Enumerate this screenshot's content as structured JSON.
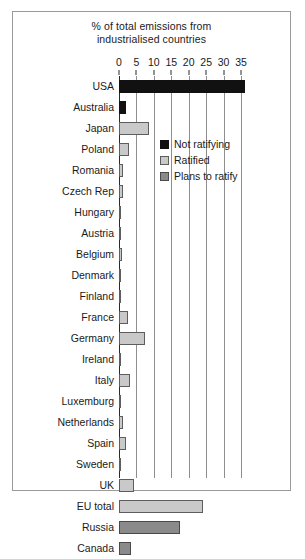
{
  "chart_data": {
    "type": "bar",
    "orientation": "horizontal",
    "title": "% of total emissions from industrialised countries",
    "title_lines": [
      "% of total emissions from",
      "industrialised countries"
    ],
    "xlabel": "",
    "ylabel": "",
    "xlim": [
      0,
      35
    ],
    "xticks": [
      0,
      5,
      10,
      15,
      20,
      25,
      30,
      35
    ],
    "xtick_labels": [
      "0",
      "5",
      "10",
      "15",
      "20",
      "25",
      "30",
      "35"
    ],
    "grid": true,
    "grid_axis": "x",
    "legend_position": "inside-upper-right",
    "categories": [
      "USA",
      "Australia",
      "Japan",
      "Poland",
      "Romania",
      "Czech Rep",
      "Hungary",
      "Austria",
      "Belgium",
      "Denmark",
      "Finland",
      "France",
      "Germany",
      "Ireland",
      "Italy",
      "Luxemburg",
      "Netherlands",
      "Spain",
      "Sweden",
      "UK",
      "EU total",
      "Russia",
      "Canada"
    ],
    "values": [
      36.1,
      2.1,
      8.5,
      3.0,
      1.2,
      1.2,
      0.5,
      0.4,
      0.8,
      0.4,
      0.4,
      2.7,
      7.4,
      0.2,
      3.1,
      0.1,
      1.2,
      1.9,
      0.4,
      4.3,
      24.2,
      17.4,
      3.3
    ],
    "point_categories": [
      "not-ratifying",
      "not-ratifying",
      "ratified",
      "ratified",
      "ratified",
      "ratified",
      "ratified",
      "ratified",
      "ratified",
      "ratified",
      "ratified",
      "ratified",
      "ratified",
      "ratified",
      "ratified",
      "ratified",
      "ratified",
      "ratified",
      "ratified",
      "ratified",
      "ratified",
      "plans",
      "plans"
    ],
    "legend": [
      {
        "key": "not-ratifying",
        "label": "Not ratifying",
        "color": "#111111"
      },
      {
        "key": "ratified",
        "label": "Ratified",
        "color": "#c9c9c9"
      },
      {
        "key": "plans",
        "label": "Plans to ratify",
        "color": "#8a8a8a"
      }
    ]
  }
}
